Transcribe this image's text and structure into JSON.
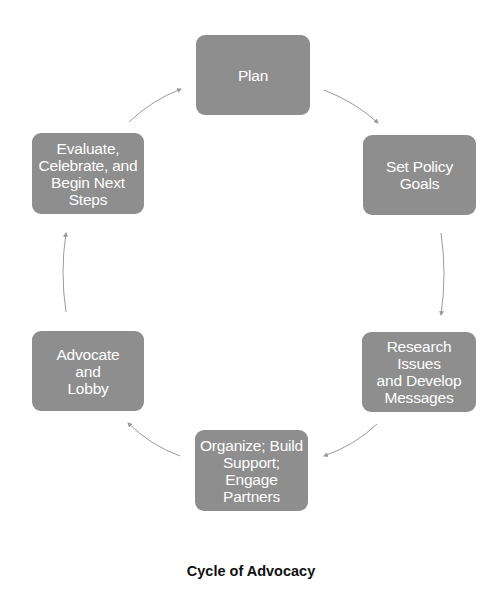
{
  "diagram": {
    "title": "Cycle of Advocacy",
    "type": "cycle",
    "node_color": "#8e8e8e",
    "arrow_color": "#9a9a9a",
    "nodes": [
      {
        "id": "plan",
        "label": "Plan"
      },
      {
        "id": "set-policy-goals",
        "label": "Set Policy\nGoals"
      },
      {
        "id": "research",
        "label": "Research\nIssues\nand Develop\nMessages"
      },
      {
        "id": "organize",
        "label": "Organize; Build\nSupport;\nEngage\nPartners"
      },
      {
        "id": "advocate",
        "label": "Advocate\nand\nLobby"
      },
      {
        "id": "evaluate",
        "label": "Evaluate,\nCelebrate, and\nBegin Next\nSteps"
      }
    ],
    "edges": [
      {
        "from": "plan",
        "to": "set-policy-goals"
      },
      {
        "from": "set-policy-goals",
        "to": "research"
      },
      {
        "from": "research",
        "to": "organize"
      },
      {
        "from": "organize",
        "to": "advocate"
      },
      {
        "from": "advocate",
        "to": "evaluate"
      },
      {
        "from": "evaluate",
        "to": "plan"
      }
    ]
  }
}
